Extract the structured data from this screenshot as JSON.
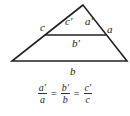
{
  "diagram": {
    "type": "similar-triangles",
    "labels": {
      "c": "c",
      "c_prime": "c′",
      "a_prime": "a′",
      "a": "a",
      "b_prime": "b′",
      "b": "b"
    },
    "formula": {
      "terms": [
        {
          "num": "a′",
          "den": "a"
        },
        {
          "num": "b′",
          "den": "b"
        },
        {
          "num": "c′",
          "den": "c"
        }
      ],
      "eq1": "=",
      "eq2": "="
    },
    "colors": {
      "line": "#222222",
      "text": "#222222"
    }
  }
}
